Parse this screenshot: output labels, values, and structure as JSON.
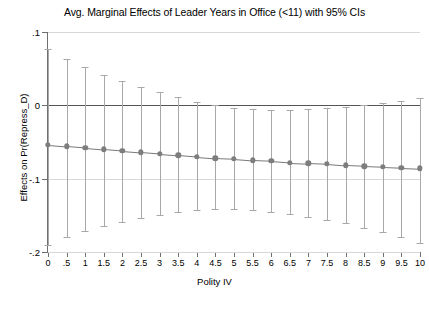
{
  "chart_data": {
    "type": "line",
    "title": "Avg. Marginal Effects of Leader Years in Office (<11) with 95% CIs",
    "xlabel": "Polity IV",
    "ylabel": "Effects on Pr(Repress_D)",
    "grid": true,
    "legend": "none",
    "xlim": [
      0,
      10
    ],
    "ylim": [
      -0.2,
      0.1
    ],
    "yticks": [
      0.1,
      0,
      -0.1,
      -0.2
    ],
    "ytick_labels": [
      ".1",
      "0",
      "-.1",
      "-.2"
    ],
    "xticks": [
      0,
      0.5,
      1,
      1.5,
      2,
      2.5,
      3,
      3.5,
      4,
      4.5,
      5,
      5.5,
      6,
      6.5,
      7,
      7.5,
      8,
      8.5,
      9,
      9.5,
      10
    ],
    "xtick_labels": [
      "0",
      ".5",
      "1",
      "1.5",
      "2",
      "2.5",
      "3",
      "3.5",
      "4",
      "4.5",
      "5",
      "5.5",
      "6",
      "6.5",
      "7",
      "7.5",
      "8",
      "8.5",
      "9",
      "9.5",
      "10"
    ],
    "reference_line_y": 0,
    "x": [
      0,
      0.5,
      1,
      1.5,
      2,
      2.5,
      3,
      3.5,
      4,
      4.5,
      5,
      5.5,
      6,
      6.5,
      7,
      7.5,
      8,
      8.5,
      9,
      9.5,
      10
    ],
    "values": [
      -0.054,
      -0.056,
      -0.058,
      -0.06,
      -0.062,
      -0.064,
      -0.066,
      -0.068,
      -0.07,
      -0.072,
      -0.073,
      -0.075,
      -0.076,
      -0.078,
      -0.079,
      -0.08,
      -0.082,
      -0.083,
      -0.084,
      -0.085,
      -0.086
    ],
    "ci_upper": [
      0.077,
      0.063,
      0.052,
      0.042,
      0.033,
      0.025,
      0.018,
      0.011,
      0.005,
      0.0,
      -0.003,
      -0.005,
      -0.006,
      -0.006,
      -0.005,
      -0.004,
      -0.002,
      0.0,
      0.003,
      0.006,
      0.01
    ],
    "ci_lower": [
      -0.19,
      -0.18,
      -0.172,
      -0.165,
      -0.159,
      -0.154,
      -0.149,
      -0.146,
      -0.143,
      -0.142,
      -0.142,
      -0.143,
      -0.145,
      -0.148,
      -0.152,
      -0.156,
      -0.161,
      -0.167,
      -0.173,
      -0.18,
      -0.188
    ],
    "series_name": "Average marginal effect",
    "colors": {
      "marker": "#7d7d7d",
      "line": "#7a7a7a",
      "ci": "#a8a8a8",
      "grid": "#d8d8d8",
      "zero_line": "#555555",
      "axis": "#6f6f6f"
    }
  }
}
